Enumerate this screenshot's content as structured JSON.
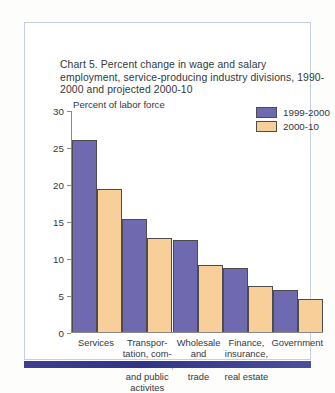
{
  "chart_data": {
    "type": "bar",
    "title": "Chart 5. Percent change in wage and salary employment, service-producing industry divisions, 1990-2000 and projected 2000-10",
    "xlabel": "",
    "ylabel": "Percent of labor force",
    "ylim": [
      0,
      30
    ],
    "yticks": [
      0,
      5,
      10,
      15,
      20,
      25,
      30
    ],
    "grid": false,
    "legend_position": "top-right",
    "categories": [
      "Services",
      "Transpor-\ntation, com-\nmunications,\nand public\nactivites",
      "Wholesale\nand\nretail\ntrade",
      "Finance,\ninsurance,\nand\nreal estate",
      "Government"
    ],
    "series": [
      {
        "name": "1999-2000",
        "color": "#6f6ab0",
        "values": [
          25.9,
          15.3,
          12.4,
          8.7,
          5.7
        ]
      },
      {
        "name": "2000-10",
        "color": "#f8cf99",
        "values": [
          19.3,
          12.7,
          9.0,
          6.2,
          4.4
        ]
      }
    ]
  },
  "axis": {
    "y_label": "Percent of labor force",
    "ticks": [
      "30",
      "25",
      "20",
      "15",
      "10",
      "5",
      "0"
    ]
  },
  "categories_display": [
    "Services",
    "Transpor-<br>tation, com-<br>munications,<br>and public<br>activites",
    "Wholesale<br>and<br>retail<br>trade",
    "Finance,<br>insurance,<br>and<br>real estate",
    "Government"
  ],
  "legend": [
    {
      "label": "1999-2000",
      "color": "#6f6ab0"
    },
    {
      "label": "2000-10",
      "color": "#f8cf99"
    }
  ],
  "colors": {
    "series1": "#6f6ab0",
    "series2": "#f8cf99",
    "header_bar": "#2f3487",
    "card_border": "#c6cee0",
    "text": "#33373d"
  }
}
